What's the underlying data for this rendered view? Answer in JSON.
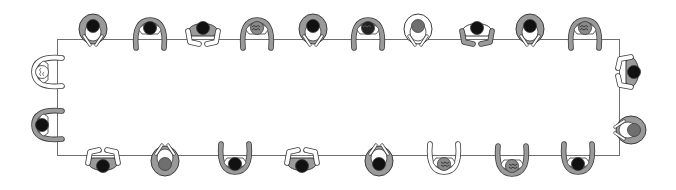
{
  "diagram": {
    "title": "Top-down view of people seated around a long rectangular conference table",
    "colors": {
      "table_outline": "#6e6e6e",
      "body_gray": "#9a9a9a",
      "body_light": "#ffffff",
      "outline": "#3a3a3a",
      "head_dark": "#111111",
      "head_gray": "#6f6f6f"
    },
    "table": {
      "x": 57,
      "y": 39,
      "width": 563,
      "height": 117
    },
    "people": [
      {
        "id": "top-1",
        "x": 93,
        "y": 30,
        "facing": "down",
        "style": "hug",
        "body": "gray",
        "head": "dark"
      },
      {
        "id": "top-2",
        "x": 150,
        "y": 32,
        "facing": "down",
        "style": "arms-out",
        "body": "light",
        "arms": "gray",
        "head": "dark"
      },
      {
        "id": "top-3",
        "x": 203,
        "y": 32,
        "facing": "down",
        "style": "elbows",
        "body": "gray",
        "arms": "light",
        "head": "dark"
      },
      {
        "id": "top-4",
        "x": 257,
        "y": 32,
        "facing": "down",
        "style": "arms-out",
        "body": "light",
        "arms": "gray",
        "head": "curly"
      },
      {
        "id": "top-5",
        "x": 313,
        "y": 30,
        "facing": "down",
        "style": "hug",
        "body": "gray",
        "head": "dark"
      },
      {
        "id": "top-6",
        "x": 368,
        "y": 32,
        "facing": "down",
        "style": "arms-out",
        "body": "light",
        "arms": "gray",
        "head": "curly-dark"
      },
      {
        "id": "top-7",
        "x": 418,
        "y": 30,
        "facing": "down",
        "style": "hug",
        "body": "light",
        "head": "gray"
      },
      {
        "id": "top-8",
        "x": 477,
        "y": 32,
        "facing": "down",
        "style": "elbows",
        "body": "light",
        "arms": "gray",
        "head": "dark"
      },
      {
        "id": "top-9",
        "x": 530,
        "y": 30,
        "facing": "down",
        "style": "hug",
        "body": "gray",
        "head": "dark"
      },
      {
        "id": "top-10",
        "x": 585,
        "y": 32,
        "facing": "down",
        "style": "arms-out",
        "body": "light",
        "arms": "gray",
        "head": "curly"
      },
      {
        "id": "left-1",
        "x": 46,
        "y": 72,
        "facing": "right",
        "style": "arms-out",
        "body": "light",
        "arms": "light",
        "head": "curly-light"
      },
      {
        "id": "left-2",
        "x": 46,
        "y": 125,
        "facing": "right",
        "style": "arms-out",
        "body": "light",
        "arms": "gray",
        "head": "dark"
      },
      {
        "id": "right-1",
        "x": 630,
        "y": 72,
        "facing": "left",
        "style": "elbows",
        "body": "gray",
        "arms": "light",
        "head": "dark"
      },
      {
        "id": "right-2",
        "x": 630,
        "y": 130,
        "facing": "left",
        "style": "hug",
        "body": "gray",
        "head": "gray"
      },
      {
        "id": "bottom-1",
        "x": 103,
        "y": 162,
        "facing": "up",
        "style": "elbows",
        "body": "gray",
        "arms": "light",
        "head": "dark"
      },
      {
        "id": "bottom-2",
        "x": 165,
        "y": 160,
        "facing": "up",
        "style": "hug",
        "body": "gray",
        "arms": "light",
        "head": "gray"
      },
      {
        "id": "bottom-3",
        "x": 235,
        "y": 160,
        "facing": "up",
        "style": "arms-out",
        "body": "light",
        "arms": "gray",
        "head": "dark"
      },
      {
        "id": "bottom-4",
        "x": 302,
        "y": 162,
        "facing": "up",
        "style": "elbows",
        "body": "gray",
        "arms": "light",
        "head": "dark"
      },
      {
        "id": "bottom-5",
        "x": 379,
        "y": 160,
        "facing": "up",
        "style": "hug",
        "body": "gray",
        "head": "dark"
      },
      {
        "id": "bottom-6",
        "x": 444,
        "y": 160,
        "facing": "up",
        "style": "arms-out",
        "body": "light",
        "arms": "light",
        "head": "curly"
      },
      {
        "id": "bottom-7",
        "x": 512,
        "y": 162,
        "facing": "up",
        "style": "arms-out",
        "body": "light",
        "arms": "gray",
        "head": "curly"
      },
      {
        "id": "bottom-8",
        "x": 578,
        "y": 160,
        "facing": "up",
        "style": "arms-out",
        "body": "light",
        "arms": "gray",
        "head": "dark"
      }
    ]
  }
}
